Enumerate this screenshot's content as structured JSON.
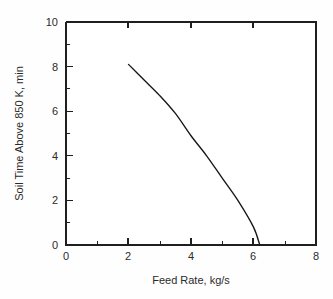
{
  "chart_data": {
    "type": "line",
    "title": "",
    "subtitle": "",
    "xlabel": "Feed Rate, kg/s",
    "ylabel": "Soil Time Above 850 K, min",
    "xlim": [
      0,
      8
    ],
    "ylim": [
      0,
      10
    ],
    "xticks": [
      0,
      2,
      4,
      6,
      8
    ],
    "xtick_labels": [
      "0",
      "2",
      "4",
      "6",
      "8"
    ],
    "yticks": [
      0,
      2,
      4,
      6,
      8,
      10
    ],
    "ytick_labels": [
      "0",
      "2",
      "4",
      "6",
      "8",
      "10"
    ],
    "x_minor_ticks": [
      1,
      3,
      5,
      7
    ],
    "y_minor_ticks": [
      1,
      3,
      5,
      7,
      9
    ],
    "grid": false,
    "legend": null,
    "legend_position": "none",
    "annotations": [],
    "series": [
      {
        "name": "Soil time above 850 K",
        "x": [
          2.0,
          2.5,
          3.0,
          3.5,
          4.0,
          4.5,
          5.0,
          5.5,
          6.0,
          6.2
        ],
        "values": [
          8.1,
          7.4,
          6.7,
          5.9,
          4.9,
          4.0,
          3.0,
          2.0,
          0.8,
          0.0
        ]
      }
    ]
  },
  "figure": {
    "background_color": "#fefefe",
    "plot_area_color": "#ffffff",
    "line_color": "#161616",
    "axis_color": "#1f1f1f",
    "text_color": "#2b2b2b"
  }
}
